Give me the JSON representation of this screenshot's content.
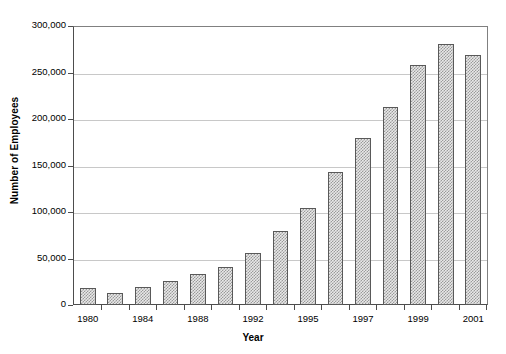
{
  "chart_data": {
    "type": "bar",
    "title": "",
    "xlabel": "Year",
    "ylabel": "Number of Employees",
    "categories": [
      "1980",
      "1982",
      "1984",
      "1986",
      "1988",
      "1990",
      "1992",
      "1993",
      "1995",
      "1996",
      "1997",
      "1998",
      "1999",
      "2000",
      "2001"
    ],
    "visible_tick_labels": [
      "1980",
      "",
      "1984",
      "",
      "1988",
      "",
      "1992",
      "",
      "1995",
      "",
      "1997",
      "",
      "1999",
      "",
      "2001"
    ],
    "values": [
      18000,
      13000,
      19000,
      26000,
      34000,
      41000,
      56000,
      80000,
      105000,
      144000,
      180000,
      214000,
      259000,
      282000,
      270000
    ],
    "ylim": [
      0,
      300000
    ],
    "ytick_values": [
      0,
      50000,
      100000,
      150000,
      200000,
      250000,
      300000
    ],
    "ytick_labels": [
      "0",
      "50,000",
      "100,000",
      "150,000",
      "200,000",
      "250,000",
      "300,000"
    ],
    "grid": true,
    "grid_axis": "y",
    "legend": false,
    "legend_position": "none",
    "bar_fill_pattern": "checkered-gray",
    "bar_border_color": "#595959",
    "gridline_color": "#c8c8c8",
    "axis_color": "#4d4d4d"
  }
}
